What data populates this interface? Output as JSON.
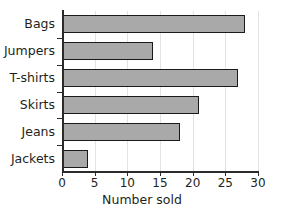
{
  "chart_data": {
    "type": "bar",
    "orientation": "horizontal",
    "title": "",
    "xlabel": "Number sold",
    "ylabel": "",
    "categories": [
      "Bags",
      "Jumpers",
      "T-shirts",
      "Skirts",
      "Jeans",
      "Jackets"
    ],
    "values": [
      28,
      14,
      27,
      21,
      18,
      4
    ],
    "xlim": [
      0,
      30
    ],
    "xticks": [
      0,
      5,
      10,
      15,
      20,
      25,
      30
    ],
    "xtick_labels": [
      "0",
      "5",
      "10",
      "15",
      "20",
      "25",
      "30"
    ],
    "grid": true,
    "grid_axis": "x",
    "legend": false,
    "bar_fill_color": "#a9a9a9",
    "bar_edge_color": "#1a1a1a",
    "axis_color": "#2b2b2b",
    "gridline_color": "#e3e3e3",
    "background_color": "#ffffff",
    "series": [
      {
        "name": "Number sold",
        "values": [
          28,
          14,
          27,
          21,
          18,
          4
        ]
      }
    ]
  }
}
